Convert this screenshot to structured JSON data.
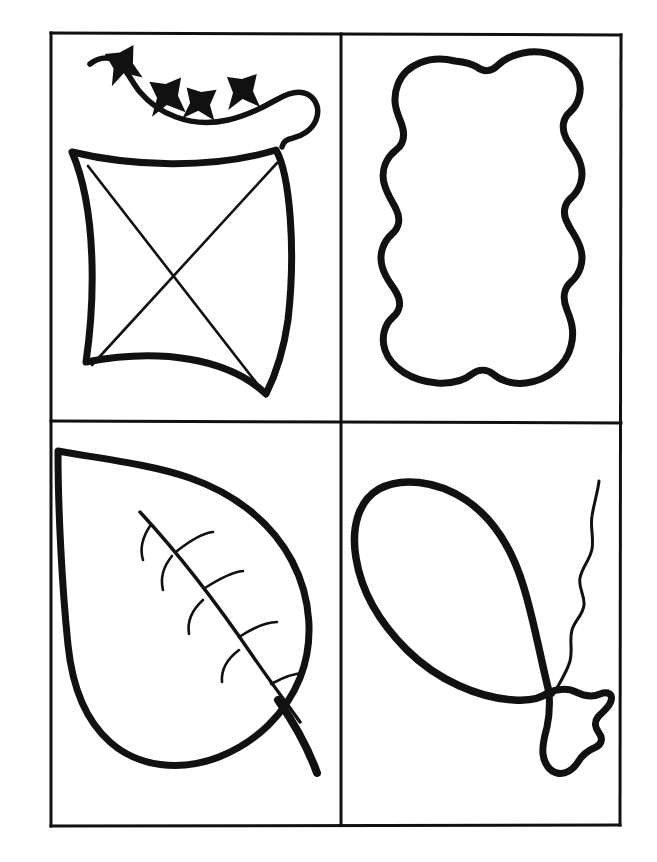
{
  "document": {
    "kind": "coloring-page-worksheet",
    "title": "Four Outline Shapes Worksheet",
    "background_color": "#ffffff",
    "ink_color": "#111111",
    "canvas": {
      "width": 657,
      "height": 862
    }
  },
  "frame": {
    "outer_border": {
      "x": 50,
      "y": 32,
      "width": 572,
      "height": 794,
      "stroke_width": 3
    },
    "divider_vertical_x": 341,
    "divider_horizontal_y": 422,
    "stroke_color": "#111111"
  },
  "panels": [
    {
      "id": "panel-top-left",
      "position": "top-left",
      "subject": "kite",
      "label": "Kite with bow tail",
      "stroke_width_outline": 7,
      "stroke_width_detail": 2.5,
      "elements": [
        "kite-body",
        "kite-diagonals",
        "kite-tail-string",
        "tail-bows"
      ],
      "bow_count": 4
    },
    {
      "id": "panel-top-right",
      "position": "top-right",
      "subject": "lumpy-blob",
      "label": "Lumpy peanut shape",
      "stroke_width_outline": 7,
      "lobes_per_side": 3,
      "elements": [
        "blob-outline"
      ]
    },
    {
      "id": "panel-bottom-left",
      "position": "bottom-left",
      "subject": "leaf",
      "label": "Leaf with veins",
      "stroke_width_outline": 7,
      "stroke_width_detail": 2.5,
      "vein_pairs": 4,
      "elements": [
        "leaf-outline",
        "leaf-midrib",
        "leaf-veins",
        "leaf-stem"
      ]
    },
    {
      "id": "panel-bottom-right",
      "position": "bottom-right",
      "subject": "balloon",
      "label": "Balloon with knot and string",
      "stroke_width_outline": 7,
      "stroke_width_detail": 3,
      "elements": [
        "balloon-body",
        "balloon-knot",
        "balloon-string"
      ]
    }
  ]
}
